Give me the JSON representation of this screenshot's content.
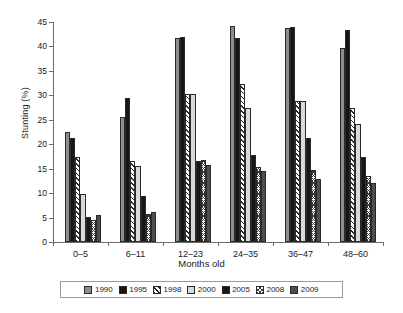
{
  "chart_data": {
    "type": "bar",
    "title": "",
    "xlabel": "Months old",
    "ylabel": "Stunting (%)",
    "categories": [
      "0–5",
      "6–11",
      "12–23",
      "24–35",
      "36–47",
      "48–60"
    ],
    "ylim": [
      0,
      45
    ],
    "yticks": [
      0,
      5,
      10,
      15,
      20,
      25,
      30,
      35,
      40,
      45
    ],
    "ytick_labels": [
      "0",
      "5",
      "10",
      "15",
      "20",
      "25",
      "30",
      "35",
      "40",
      "45"
    ],
    "grid": false,
    "legend_position": "bottom",
    "series": [
      {
        "name": "1990",
        "fill": "grey-solid",
        "color": "#8e8e8e",
        "values": [
          22.6,
          25.6,
          41.8,
          44.1,
          43.7,
          39.7
        ]
      },
      {
        "name": "1995",
        "fill": "black-solid",
        "color": "#161616",
        "values": [
          21.2,
          29.4,
          42.0,
          41.8,
          44.0,
          43.4
        ]
      },
      {
        "name": "1998",
        "fill": "diagonal-hatch",
        "color": "#2b2b2b",
        "values": [
          17.3,
          16.6,
          30.3,
          32.4,
          28.8,
          27.4
        ]
      },
      {
        "name": "2000",
        "fill": "light-grey-solid",
        "color": "#d9d9d9",
        "values": [
          9.9,
          15.5,
          30.2,
          27.4,
          28.9,
          24.1
        ]
      },
      {
        "name": "2005",
        "fill": "black-solid-2",
        "color": "#161616",
        "values": [
          5.2,
          9.5,
          16.6,
          17.9,
          21.3,
          17.4
        ]
      },
      {
        "name": "2008",
        "fill": "dotted-hatch",
        "color": "#3a3a3a",
        "values": [
          4.5,
          5.8,
          16.7,
          15.4,
          14.8,
          13.6
        ]
      },
      {
        "name": "2009",
        "fill": "dark-grey-solid",
        "color": "#4e4e4e",
        "values": [
          5.6,
          6.2,
          15.7,
          14.5,
          12.8,
          12.0
        ]
      }
    ]
  },
  "legend": {
    "items": [
      {
        "label": "1990"
      },
      {
        "label": "1995"
      },
      {
        "label": "1998"
      },
      {
        "label": "2000"
      },
      {
        "label": "2005"
      },
      {
        "label": "2008"
      },
      {
        "label": "2009"
      }
    ]
  }
}
